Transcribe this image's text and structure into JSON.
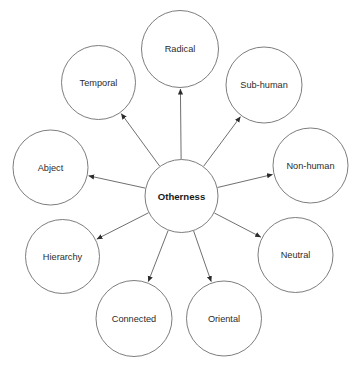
{
  "diagram": {
    "type": "radial-hub-and-spoke",
    "background_color": "#ffffff",
    "stroke_color": "#6e6e6e",
    "edge_color": "#555555",
    "label_color": "#2b2b2b",
    "center_label_color": "#1a1a1a",
    "center": {
      "label": "Otherness",
      "cx": 181.5,
      "cy": 196,
      "r": 36.5,
      "bold": true
    },
    "edge_style": {
      "direction": "center-to-periphery",
      "arrowhead": "solid-triangle"
    },
    "nodes": [
      {
        "id": "radical",
        "label": "Radical",
        "cx": 180,
        "cy": 49,
        "r": 38.5,
        "angle_deg": 90
      },
      {
        "id": "sub-human",
        "label": "Sub-human",
        "cx": 264,
        "cy": 85,
        "r": 38,
        "angle_deg": 49
      },
      {
        "id": "non-human",
        "label": "Non-human",
        "cx": 310.5,
        "cy": 165.5,
        "r": 37.5,
        "angle_deg": 11
      },
      {
        "id": "neutral",
        "label": "Neutral",
        "cx": 295.5,
        "cy": 255,
        "r": 37.5,
        "angle_deg": -31
      },
      {
        "id": "oriental",
        "label": "Oriental",
        "cx": 224,
        "cy": 318.5,
        "r": 37.5,
        "angle_deg": -71
      },
      {
        "id": "connected",
        "label": "Connected",
        "cx": 134,
        "cy": 318.5,
        "r": 38,
        "angle_deg": -109
      },
      {
        "id": "hierarchy",
        "label": "Hierarchy",
        "cx": 62.5,
        "cy": 256.5,
        "r": 37,
        "angle_deg": -149
      },
      {
        "id": "abject",
        "label": "Abject",
        "cx": 50.5,
        "cy": 167.5,
        "r": 37.5,
        "angle_deg": 176
      },
      {
        "id": "temporal",
        "label": "Temporal",
        "cx": 98.5,
        "cy": 82.5,
        "r": 37,
        "angle_deg": 133
      }
    ]
  }
}
